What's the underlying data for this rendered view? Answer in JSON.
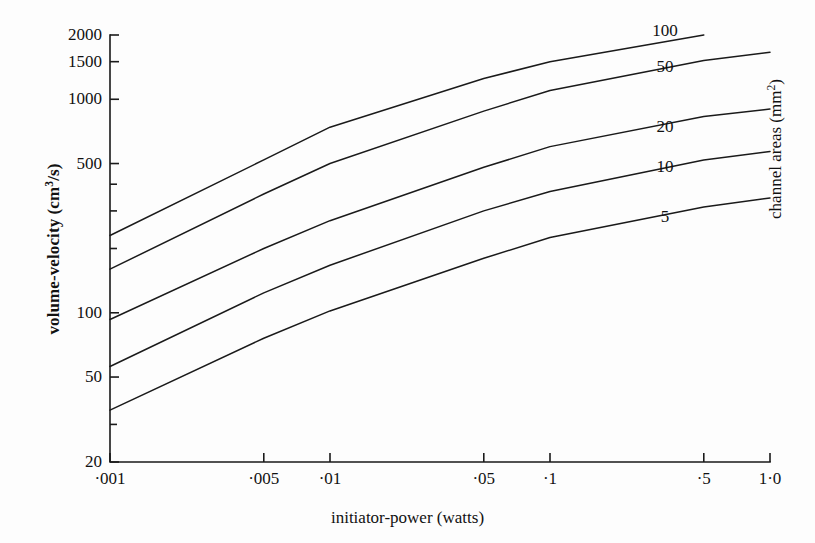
{
  "figure": {
    "background": "#fdfdfd",
    "ink": "#1a1a1a"
  },
  "axes": {
    "x_title": "initiator-power (watts)",
    "y_title_html": "volume-velocity (cm³/s)",
    "y_title": "volume-velocity (cm3/s)",
    "right_title_html": "channel areas (mm²)",
    "right_title": "channel areas (mm2)",
    "x_ticks": [
      {
        "value": 0.001,
        "label": "·001",
        "major": true
      },
      {
        "value": 0.005,
        "label": "·005",
        "major": true
      },
      {
        "value": 0.01,
        "label": "·01",
        "major": true
      },
      {
        "value": 0.05,
        "label": "·05",
        "major": true
      },
      {
        "value": 0.1,
        "label": "·1",
        "major": true
      },
      {
        "value": 0.5,
        "label": "·5",
        "major": true
      },
      {
        "value": 1.0,
        "label": "1·0",
        "major": true
      }
    ],
    "y_ticks": [
      {
        "value": 2000,
        "label": "2000",
        "major": true
      },
      {
        "value": 1500,
        "label": "1500",
        "major": true
      },
      {
        "value": 1000,
        "label": "1000",
        "major": true
      },
      {
        "value": 500,
        "label": "500",
        "major": true
      },
      {
        "value": 400,
        "label": "",
        "major": false
      },
      {
        "value": 300,
        "label": "",
        "major": false
      },
      {
        "value": 200,
        "label": "",
        "major": false
      },
      {
        "value": 100,
        "label": "100",
        "major": true
      },
      {
        "value": 50,
        "label": "50",
        "major": true
      },
      {
        "value": 30,
        "label": "",
        "major": false
      },
      {
        "value": 20,
        "label": "20",
        "major": true
      }
    ],
    "x_scale": "log",
    "y_scale": "log",
    "xlim": [
      0.001,
      1.0
    ],
    "ylim": [
      20,
      2000
    ],
    "frame": "left-and-bottom-spines"
  },
  "chart_data": {
    "type": "line",
    "title": "",
    "xlabel": "initiator-power (watts)",
    "ylabel": "volume-velocity (cm3/s)",
    "right_axis_label": "channel areas (mm2)",
    "x_scale": "log",
    "y_scale": "log",
    "xlim": [
      0.001,
      1.0
    ],
    "ylim": [
      20,
      2000
    ],
    "grid": false,
    "legend": "inline-line-labels",
    "series_unit": "mm2",
    "series": [
      {
        "name": "100",
        "label": "100",
        "channel_area_mm2": 100,
        "x": [
          0.001,
          0.005,
          0.01,
          0.05,
          0.1,
          0.5
        ],
        "y": [
          230,
          520,
          740,
          1250,
          1500,
          2000
        ]
      },
      {
        "name": "50",
        "label": "50",
        "channel_area_mm2": 50,
        "x": [
          0.001,
          0.005,
          0.01,
          0.05,
          0.1,
          0.5,
          1.0
        ],
        "y": [
          160,
          360,
          500,
          880,
          1100,
          1520,
          1660
        ]
      },
      {
        "name": "20",
        "label": "20",
        "channel_area_mm2": 20,
        "x": [
          0.001,
          0.005,
          0.01,
          0.05,
          0.1,
          0.5,
          1.0
        ],
        "y": [
          93,
          200,
          270,
          480,
          600,
          830,
          900
        ]
      },
      {
        "name": "10",
        "label": "10",
        "channel_area_mm2": 10,
        "x": [
          0.001,
          0.005,
          0.01,
          0.05,
          0.1,
          0.5,
          1.0
        ],
        "y": [
          56,
          124,
          167,
          300,
          370,
          520,
          570
        ]
      },
      {
        "name": "5",
        "label": "5",
        "channel_area_mm2": 5,
        "x": [
          0.001,
          0.005,
          0.01,
          0.05,
          0.1,
          0.5,
          1.0
        ],
        "y": [
          35,
          76,
          102,
          180,
          225,
          313,
          345
        ]
      }
    ],
    "curve_labels": [
      {
        "text": "100",
        "x_px": 665,
        "y_px": 30
      },
      {
        "text": "50",
        "x_px": 665,
        "y_px": 66
      },
      {
        "text": "20",
        "x_px": 665,
        "y_px": 126
      },
      {
        "text": "10",
        "x_px": 665,
        "y_px": 166
      },
      {
        "text": "5",
        "x_px": 665,
        "y_px": 216
      }
    ]
  },
  "geometry": {
    "plot_left_px": 110,
    "plot_right_px": 770,
    "plot_top_px": 35,
    "plot_bottom_px": 462
  }
}
